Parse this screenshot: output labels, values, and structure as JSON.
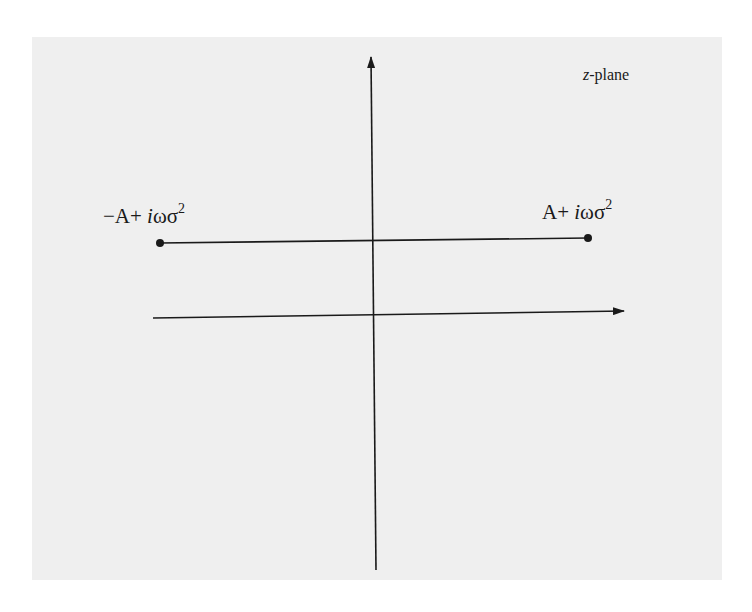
{
  "diagram": {
    "plane_label": {
      "var": "z",
      "rest": "-plane"
    },
    "points": [
      {
        "name": "left-endpoint",
        "prefix": "−A+ ",
        "imag": "i",
        "rest": "ωσ",
        "exp": "2"
      },
      {
        "name": "right-endpoint",
        "prefix": "A+ ",
        "imag": "i",
        "rest": "ωσ",
        "exp": "2"
      }
    ],
    "colors": {
      "background": "#efefef",
      "ink": "#1a1a1a"
    }
  }
}
